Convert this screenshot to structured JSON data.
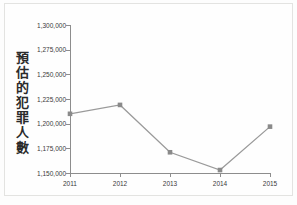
{
  "chart_data": {
    "type": "line",
    "title": "",
    "xlabel": "",
    "ylabel": "預估的犯罪人數",
    "categories": [
      "2011",
      "2012",
      "2013",
      "2014",
      "2015"
    ],
    "x": [
      2011,
      2012,
      2013,
      2014,
      2015
    ],
    "values": [
      1210000,
      1219000,
      1171000,
      1153000,
      1197000
    ],
    "series": [
      {
        "name": "預估的犯罪人數",
        "values": [
          1210000,
          1219000,
          1171000,
          1153000,
          1197000
        ]
      }
    ],
    "ylim": [
      1150000,
      1300000
    ],
    "yticks": [
      1150000,
      1175000,
      1200000,
      1225000,
      1250000,
      1275000,
      1300000
    ],
    "ytick_labels": [
      "1,150,000",
      "1,175,000",
      "1,200,000",
      "1,225,000",
      "1,250,000",
      "1,275,000",
      "1,300,000"
    ],
    "xtick_labels": [
      "2011",
      "2012",
      "2013",
      "2014",
      "2015"
    ],
    "grid": false,
    "legend": false,
    "legend_position": "none",
    "marker": "square",
    "line_color": "#9a9a9a",
    "marker_color": "#8a8a8a",
    "axis_color": "#8d8d8d",
    "text_color": "#3a3a3a",
    "background_color": "#fefefe"
  },
  "axis": {
    "y_title": "預估的犯罪人數"
  }
}
